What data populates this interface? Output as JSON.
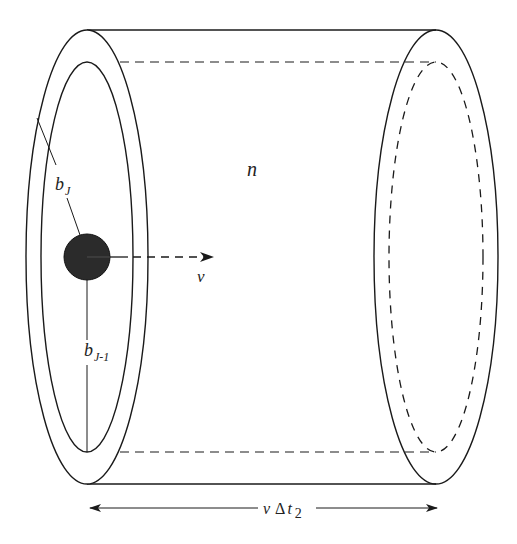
{
  "diagram": {
    "type": "cylinder-shell-schematic",
    "labels": {
      "density": "n",
      "velocity": "v",
      "outer_radius": "b",
      "outer_radius_sub": "J",
      "inner_radius": "b",
      "inner_radius_sub": "J-1",
      "length_v": "v",
      "length_delta": "Δ",
      "length_t": "t",
      "length_sub": "2"
    },
    "colors": {
      "stroke": "#1a1a1a",
      "particle_fill": "#2b2b2b",
      "background": "#ffffff"
    },
    "geometry": {
      "left_outer_ellipse": {
        "cx": 87,
        "cy": 257,
        "rx": 61,
        "ry": 227
      },
      "left_inner_ellipse": {
        "cx": 87,
        "cy": 257,
        "rx": 46,
        "ry": 195
      },
      "right_outer_ellipse": {
        "cx": 436,
        "cy": 257,
        "rx": 62,
        "ry": 227
      },
      "right_inner_ellipse_dashed": {
        "cx": 436,
        "cy": 257,
        "rx": 47,
        "ry": 195
      },
      "particle": {
        "cx": 87,
        "cy": 257,
        "r": 23
      }
    }
  }
}
